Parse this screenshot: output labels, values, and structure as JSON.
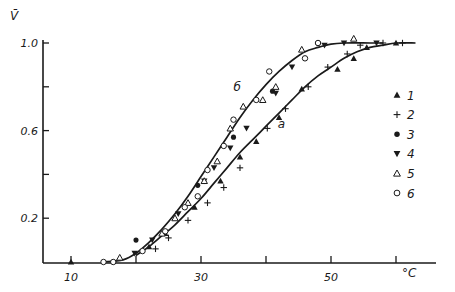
{
  "chart_data": {
    "type": "scatter",
    "title": "",
    "ylabel": "V̄",
    "xlabel": "°C",
    "xlim": [
      0,
      66
    ],
    "ylim": [
      0,
      1.05
    ],
    "x_ticks": [
      10,
      20,
      30,
      40,
      50,
      60
    ],
    "x_tick_labels": [
      "10",
      "",
      "30",
      "",
      "50",
      ""
    ],
    "y_ticks": [
      0.2,
      0.4,
      0.6,
      0.8,
      1.0
    ],
    "y_tick_labels": [
      "0.2",
      "",
      "0.6",
      "",
      "1.0"
    ],
    "grid": false,
    "legend_position": "right",
    "curves": [
      {
        "label": "б",
        "label_pos": [
          35,
          0.78
        ],
        "x": [
          15,
          18,
          20,
          22,
          24,
          26,
          28,
          30,
          32,
          34,
          36,
          38,
          40,
          42,
          44,
          46,
          48,
          50,
          52,
          56,
          58
        ],
        "y": [
          0.0,
          0.01,
          0.04,
          0.09,
          0.15,
          0.22,
          0.3,
          0.39,
          0.48,
          0.57,
          0.66,
          0.74,
          0.81,
          0.87,
          0.92,
          0.96,
          0.98,
          0.995,
          1.0,
          1.0,
          1.0
        ]
      },
      {
        "label": "a",
        "label_pos": [
          41.8,
          0.61
        ],
        "x": [
          20,
          22,
          24,
          26,
          28,
          30,
          32,
          34,
          36,
          38,
          40,
          42,
          44,
          46,
          48,
          50,
          52,
          54,
          56,
          58,
          60,
          63
        ],
        "y": [
          0.03,
          0.07,
          0.12,
          0.17,
          0.23,
          0.29,
          0.36,
          0.43,
          0.5,
          0.56,
          0.62,
          0.68,
          0.74,
          0.8,
          0.85,
          0.89,
          0.93,
          0.96,
          0.98,
          0.99,
          1.0,
          1.0
        ]
      }
    ],
    "series": [
      {
        "name": "1",
        "marker": "triangle-up-filled",
        "x": [
          10,
          22,
          24.5,
          29,
          33,
          36,
          38.5,
          42,
          45.5,
          51,
          53.5,
          55.5,
          60
        ],
        "y": [
          0.0,
          0.07,
          0.13,
          0.25,
          0.37,
          0.48,
          0.55,
          0.66,
          0.79,
          0.88,
          0.93,
          0.98,
          1.0
        ]
      },
      {
        "name": "2",
        "marker": "plus",
        "x": [
          23,
          25,
          28,
          31,
          33.5,
          36,
          40.2,
          43,
          46.5,
          49.5,
          52.5,
          54.5,
          58,
          61
        ],
        "y": [
          0.06,
          0.11,
          0.19,
          0.27,
          0.34,
          0.43,
          0.61,
          0.7,
          0.8,
          0.89,
          0.95,
          0.99,
          1.0,
          1.0
        ]
      },
      {
        "name": "3",
        "marker": "circle-filled",
        "x": [
          20,
          29.5,
          35,
          41,
          48
        ],
        "y": [
          0.1,
          0.35,
          0.57,
          0.78,
          1.0
        ]
      },
      {
        "name": "4",
        "marker": "triangle-down-filled",
        "x": [
          19.8,
          22.5,
          26.5,
          30.5,
          32,
          34.5,
          37,
          41.5,
          44,
          49,
          52,
          57
        ],
        "y": [
          0.04,
          0.1,
          0.22,
          0.37,
          0.43,
          0.52,
          0.61,
          0.77,
          0.89,
          0.99,
          1.0,
          1.0
        ]
      },
      {
        "name": "5",
        "marker": "triangle-up-open",
        "x": [
          17.5,
          24,
          26,
          28,
          30.5,
          32.5,
          34.5,
          36.5,
          39.5,
          41.5,
          45.5,
          53.5
        ],
        "y": [
          0.02,
          0.13,
          0.2,
          0.27,
          0.37,
          0.46,
          0.61,
          0.71,
          0.74,
          0.8,
          0.97,
          1.02
        ]
      },
      {
        "name": "6",
        "marker": "circle-open",
        "x": [
          15,
          16.5,
          21,
          24.5,
          27.5,
          29.5,
          31,
          33.5,
          35,
          38.5,
          40.5,
          46,
          48
        ],
        "y": [
          0.0,
          0.0,
          0.05,
          0.14,
          0.25,
          0.3,
          0.42,
          0.53,
          0.65,
          0.74,
          0.87,
          0.93,
          1.0
        ]
      }
    ],
    "legend": [
      {
        "marker": "triangle-up-filled",
        "label": "1"
      },
      {
        "marker": "plus",
        "label": "2"
      },
      {
        "marker": "circle-filled",
        "label": "3"
      },
      {
        "marker": "triangle-down-filled",
        "label": "4"
      },
      {
        "marker": "triangle-up-open",
        "label": "5"
      },
      {
        "marker": "circle-open",
        "label": "6"
      }
    ]
  },
  "colors": {
    "ink": "#1a1a1a",
    "background": "#ffffff"
  }
}
